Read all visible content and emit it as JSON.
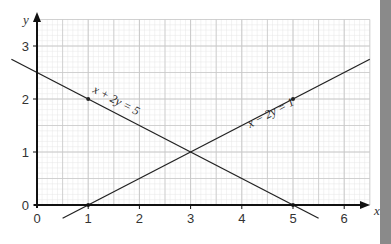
{
  "chart_data": {
    "type": "line",
    "title": "",
    "xlabel": "x",
    "ylabel": "y",
    "xlim": [
      0,
      6.5
    ],
    "ylim": [
      0,
      3.5
    ],
    "x_ticks": [
      "0",
      "1",
      "2",
      "3",
      "4",
      "5",
      "6"
    ],
    "y_ticks": [
      "0",
      "1",
      "2",
      "3"
    ],
    "grid": true,
    "series": [
      {
        "name": "x + 2y = 5",
        "label": "x + 2y = 5",
        "x": [
          -0.5,
          5.5
        ],
        "y": [
          2.75,
          -0.25
        ],
        "marked_points": [
          [
            1,
            2
          ],
          [
            5,
            0
          ]
        ]
      },
      {
        "name": "x - 2y = 1",
        "label": "x − 2y = 1",
        "x": [
          0.5,
          6.5
        ],
        "y": [
          -0.25,
          2.75
        ],
        "marked_points": [
          [
            1,
            0
          ],
          [
            5,
            2
          ]
        ]
      }
    ],
    "intersection": [
      3,
      1
    ]
  },
  "colors": {
    "grid_major": "#c8c8c8",
    "grid_minor": "#e6e6e6",
    "axis": "#111111",
    "line": "#222222",
    "side_bar": "#8a8a8a"
  }
}
